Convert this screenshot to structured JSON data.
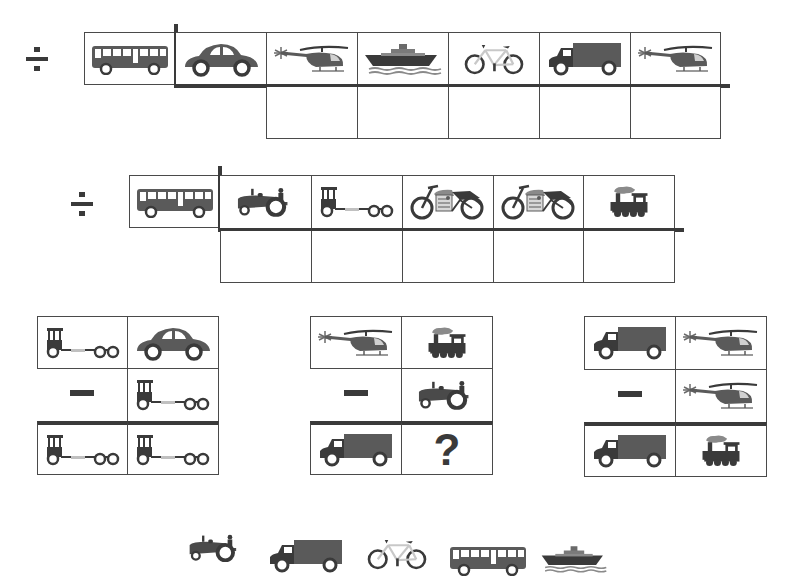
{
  "colors": {
    "ink": "#3a3a3a",
    "fill": "#5a5a5a",
    "light": "#c8c8c8",
    "border": "#4a4a4a"
  },
  "division_problems": [
    {
      "operator": "÷",
      "divisor": "bus",
      "dividend": [
        "car",
        "helicopter",
        "ship",
        "bicycle",
        "truck",
        "helicopter"
      ],
      "answer_cells": 5
    },
    {
      "operator": "÷",
      "divisor": "bus",
      "dividend": [
        "tractor",
        "tractor-trailer",
        "motorcycle",
        "motorcycle",
        "train"
      ],
      "answer_cells": 5
    }
  ],
  "subtraction_problems": [
    {
      "operator": "−",
      "minuend": [
        "tractor-trailer",
        "car"
      ],
      "subtrahend": [
        "tractor-trailer"
      ],
      "result": [
        "tractor-trailer",
        "tractor-trailer"
      ]
    },
    {
      "operator": "−",
      "minuend": [
        "helicopter",
        "train"
      ],
      "subtrahend": [
        "tractor"
      ],
      "result": [
        "truck",
        "?"
      ]
    },
    {
      "operator": "−",
      "minuend": [
        "truck",
        "helicopter"
      ],
      "subtrahend": [
        "helicopter"
      ],
      "result": [
        "truck",
        "train"
      ]
    }
  ],
  "unknown_symbol": "?",
  "answer_choices": [
    "tractor",
    "truck",
    "bicycle",
    "bus",
    "ship"
  ]
}
